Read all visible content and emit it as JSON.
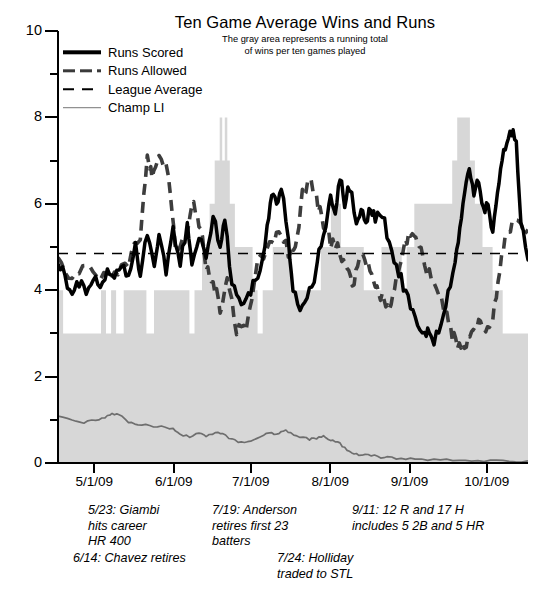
{
  "chart_data": {
    "type": "area",
    "title": "Ten Game Average Wins and Runs",
    "subtitle_line1": "The gray area represents a running total",
    "subtitle_line2": "of wins per ten games played",
    "xlabel": "",
    "ylabel": "",
    "ylim": [
      0,
      10
    ],
    "y_major_ticks": [
      0,
      2,
      4,
      6,
      8,
      10
    ],
    "y_major_tick_labels": [
      "0",
      "2",
      "4",
      "6",
      "8",
      "10"
    ],
    "y_minor_ticks": [
      1,
      3,
      5,
      7,
      9
    ],
    "grid": false,
    "legend_position": "upper-left-inside",
    "x_tick_labels": [
      "5/1/09",
      "6/1/09",
      "7/1/09",
      "8/1/09",
      "9/1/09",
      "10/1/09"
    ],
    "x_tick_positions": [
      0.075,
      0.244,
      0.408,
      0.577,
      0.746,
      0.91
    ],
    "x_range_start": "4/20/09",
    "x_range_end": "10/5/09",
    "league_average_value": 4.85,
    "series": [
      {
        "name": "Wins per ten games (gray area)",
        "style": "area",
        "color": "#d7d7d7",
        "values": [
          4.0,
          4.0,
          3.0,
          3.0,
          3.0,
          3.0,
          3.0,
          3.0,
          3.0,
          3.0,
          3.0,
          3.0,
          3.0,
          3.0,
          3.0,
          3.0,
          3.0,
          4.0,
          4.0,
          3.0,
          3.0,
          4.0,
          4.0,
          3.0,
          3.0,
          3.0,
          4.0,
          4.0,
          4.0,
          4.0,
          4.0,
          4.0,
          4.0,
          4.0,
          4.0,
          3.0,
          3.0,
          3.0,
          4.0,
          4.0,
          4.0,
          4.0,
          4.0,
          4.0,
          4.0,
          4.0,
          4.0,
          4.0,
          4.0,
          4.0,
          4.0,
          4.0,
          3.0,
          3.0,
          4.0,
          4.0,
          4.0,
          5.0,
          5.0,
          5.0,
          6.0,
          6.0,
          7.0,
          7.0,
          8.0,
          7.0,
          8.0,
          7.0,
          6.0,
          6.0,
          5.0,
          5.0,
          5.0,
          5.0,
          5.0,
          5.0,
          5.0,
          4.0,
          4.0,
          3.0,
          3.0,
          4.0,
          4.0,
          4.0,
          4.0,
          5.0,
          5.0,
          5.0,
          5.0,
          5.0,
          5.0,
          5.0,
          4.0,
          4.0,
          4.0,
          4.0,
          4.0,
          4.0,
          4.0,
          4.0,
          4.0,
          4.0,
          4.0,
          4.0,
          5.0,
          5.0,
          5.0,
          5.0,
          6.0,
          6.0,
          6.0,
          6.0,
          5.0,
          5.0,
          5.0,
          5.0,
          5.0,
          5.0,
          5.0,
          5.0,
          5.0,
          4.0,
          4.0,
          4.0,
          4.0,
          4.0,
          4.0,
          4.0,
          5.0,
          5.0,
          5.0,
          5.0,
          5.0,
          5.0,
          5.0,
          5.0,
          4.0,
          4.0,
          5.0,
          5.0,
          5.0,
          6.0,
          6.0,
          6.0,
          6.0,
          6.0,
          6.0,
          6.0,
          6.0,
          6.0,
          6.0,
          6.0,
          6.0,
          6.0,
          6.0,
          6.0,
          7.0,
          7.0,
          8.0,
          8.0,
          8.0,
          8.0,
          8.0,
          7.0,
          7.0,
          6.0,
          6.0,
          6.0,
          5.0,
          5.0,
          5.0,
          5.0,
          4.0,
          4.0,
          4.0,
          4.0,
          3.0,
          3.0,
          3.0,
          3.0,
          3.0,
          3.0,
          3.0,
          3.0,
          3.0,
          3.0
        ],
        "min": 3.0,
        "max": 8.2
      },
      {
        "name": "Runs Scored",
        "style": "solid-thick",
        "color": "#000000",
        "approx_min": 2.8,
        "approx_max": 7.7,
        "start_value": 4.7,
        "end_value": 4.7
      },
      {
        "name": "Runs Allowed",
        "style": "dashed-thick",
        "color": "#3d3d3d",
        "approx_min": 2.6,
        "approx_max": 7.2,
        "start_value": 4.8,
        "end_value": 5.4
      },
      {
        "name": "League Average",
        "style": "dashed-thin",
        "color": "#000000",
        "constant_value": 4.85
      },
      {
        "name": "Champ LI",
        "style": "solid-thin",
        "color": "#6e6e6e",
        "approx_min": 0.0,
        "approx_max": 1.2,
        "start_value": 1.1,
        "end_value": 0.05
      }
    ],
    "legend": [
      {
        "label": "Runs Scored",
        "key": "solid-thick"
      },
      {
        "label": "Runs Allowed",
        "key": "dashed-thick"
      },
      {
        "label": "League Average",
        "key": "dashed-thin"
      },
      {
        "label": "Champ LI",
        "key": "solid-thin"
      }
    ],
    "annotations": [
      {
        "id": "ann-0",
        "text": "5/23: Giambi\nhits career\nHR 400"
      },
      {
        "id": "ann-1",
        "text": "6/14: Chavez retires"
      },
      {
        "id": "ann-2",
        "text": "7/19: Anderson\nretires first 23\nbatters"
      },
      {
        "id": "ann-3",
        "text": "7/24: Holliday\ntraded to STL"
      },
      {
        "id": "ann-4",
        "text": "9/11: 12 R and 17 H\nincludes 5 2B and 5 HR"
      }
    ]
  },
  "colors": {
    "area_fill": "#d7d7d7",
    "runs_scored": "#000000",
    "runs_allowed": "#3d3d3d",
    "league_average": "#000000",
    "champ_li": "#6e6e6e",
    "axis": "#000000",
    "background": "#ffffff"
  }
}
